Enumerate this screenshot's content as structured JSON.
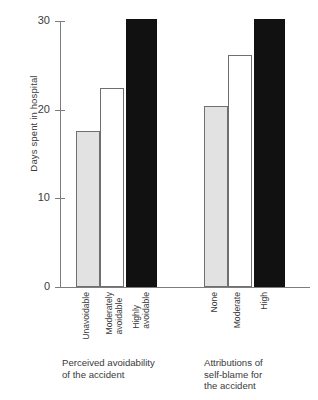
{
  "chart_data": {
    "type": "bar",
    "title": "",
    "subtitle": "",
    "xlabel": "",
    "ylabel": "Days spent in hospital",
    "ylim": [
      0,
      31
    ],
    "yticks": [
      0,
      10,
      20,
      30
    ],
    "ytick_labels": [
      "0",
      "10",
      "20",
      "30"
    ],
    "grid": false,
    "legend": "none",
    "categories": [
      "Unavoidable",
      "Moderately\navoidable",
      "Highly\navoidable",
      "None",
      "Moderate",
      "High"
    ],
    "values": [
      17.6,
      22.4,
      30.2,
      20.4,
      26.2,
      30.2
    ],
    "bar_styles": [
      "light",
      "open",
      "dark",
      "light",
      "open",
      "dark"
    ],
    "groups": [
      {
        "caption": "Perceived avoidability\nof the accident",
        "categories": [
          "Unavoidable",
          "Moderately\navoidable",
          "Highly\navoidable"
        ],
        "values": [
          17.6,
          22.4,
          30.2
        ]
      },
      {
        "caption": "Attributions of\nself-blame for\nthe accident",
        "categories": [
          "None",
          "Moderate",
          "High"
        ],
        "values": [
          20.4,
          26.2,
          30.2
        ]
      }
    ],
    "colors": {
      "light_bar_fill": "#e2e2e2",
      "open_bar_fill": "#ffffff",
      "dark_bar_fill": "#111111",
      "bar_outline": "#6f6f6f",
      "axis": "#7d7d7d",
      "text": "#3a3a3a",
      "background": "#ffffff"
    }
  }
}
